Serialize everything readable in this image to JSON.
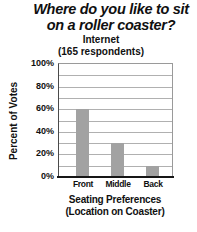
{
  "title": {
    "line1": "Where do you like to sit",
    "line2": "on a roller coaster?"
  },
  "subtitle": {
    "line1": "Internet",
    "line2": "(165 respondents)"
  },
  "x_axis_title": {
    "line1": "Seating Preferences",
    "line2": "(Location on Coaster)"
  },
  "chart_data": {
    "type": "bar",
    "title": "Where do you like to sit on a roller coaster?",
    "subtitle": "Internet (165 respondents)",
    "categories": [
      "Front",
      "Middle",
      "Back"
    ],
    "values": [
      60,
      30,
      10
    ],
    "value_unit": "%",
    "xlabel": "Seating Preferences (Location on Coaster)",
    "ylabel": "Percent of Votes",
    "ylim": [
      0,
      100
    ],
    "ytick_step": 20,
    "gridline_step": 10,
    "grid": true,
    "legend": false,
    "bar_color": "#a2a2a2",
    "gridline_color": "#b0b0b0",
    "axis_color": "#161616"
  }
}
